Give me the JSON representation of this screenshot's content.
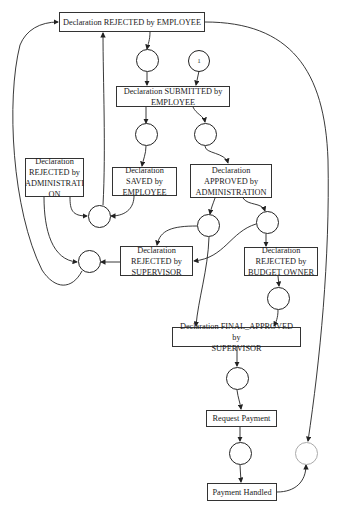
{
  "diagram": {
    "type": "petri-net",
    "transitions": [
      {
        "id": "t_rej_emp",
        "label": "Declaration REJECTED by EMPLOYEE"
      },
      {
        "id": "t_submitted",
        "label": "Declaration SUBMITTED by\nEMPLOYEE"
      },
      {
        "id": "t_rej_admin",
        "label": "Declaration\nREJECTED by\nADMINISTRATI\nON"
      },
      {
        "id": "t_saved",
        "label": "Declaration\nSAVED by\nEMPLOYEE"
      },
      {
        "id": "t_approved_admin",
        "label": "Declaration\nAPPROVED by\nADMINISTRATION"
      },
      {
        "id": "t_rej_sup",
        "label": "Declaration\nREJECTED by\nSUPERVISOR"
      },
      {
        "id": "t_rej_budget",
        "label": "Declaration\nREJECTED by\nBUDGET OWNER"
      },
      {
        "id": "t_final",
        "label": "Declaration FINAL_APPROVED by\nSUPERVISOR"
      },
      {
        "id": "t_request_payment",
        "label": "Request Payment"
      },
      {
        "id": "t_payment_handled",
        "label": "Payment Handled"
      }
    ],
    "places": [
      {
        "id": "p_after_rej_emp",
        "token": ""
      },
      {
        "id": "p_start",
        "token": "1"
      },
      {
        "id": "p_after_sub_left",
        "token": ""
      },
      {
        "id": "p_after_sub_right",
        "token": ""
      },
      {
        "id": "p_rework_upper",
        "token": ""
      },
      {
        "id": "p_rework_lower",
        "token": ""
      },
      {
        "id": "p_after_approved_left",
        "token": ""
      },
      {
        "id": "p_after_approved_right",
        "token": ""
      },
      {
        "id": "p_after_budget",
        "token": ""
      },
      {
        "id": "p_after_final",
        "token": ""
      },
      {
        "id": "p_after_request",
        "token": ""
      },
      {
        "id": "p_end",
        "token": ""
      }
    ]
  }
}
